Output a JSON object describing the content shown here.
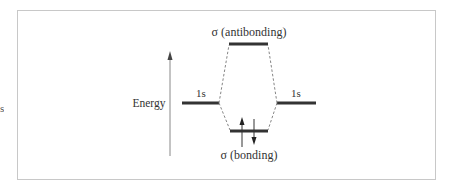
{
  "diagram": {
    "type": "molecular-orbital-energy-diagram",
    "axis": {
      "label": "Energy",
      "direction": "up"
    },
    "left_atomic_orbital": {
      "label": "1s"
    },
    "right_atomic_orbital": {
      "label": "1s"
    },
    "antibonding_orbital": {
      "label": "σ (antibonding)",
      "electrons": 0
    },
    "bonding_orbital": {
      "label": "σ (bonding)",
      "electrons": 2,
      "spins": [
        "up",
        "down"
      ]
    },
    "left_edge_fragment": "s"
  },
  "colors": {
    "frame": "#c8c8c8",
    "level_bar": "#333333",
    "axis": "#888888",
    "dashed_connector": "#777777",
    "text": "#333333"
  }
}
